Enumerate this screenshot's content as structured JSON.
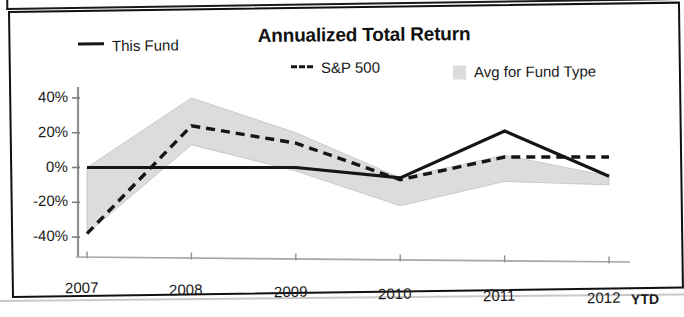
{
  "chart_data": {
    "type": "line",
    "title": "Annualized Total Return",
    "xlabel": "",
    "ylabel": "",
    "categories": [
      "2007",
      "2008",
      "2009",
      "2010",
      "2011",
      "2012"
    ],
    "x_axis_suffix_label": "YTD",
    "ytick_labels": [
      "40%",
      "20%",
      "0%",
      "-20%",
      "-40%"
    ],
    "ytick_values": [
      40,
      20,
      0,
      -20,
      -40
    ],
    "ylim": [
      -48,
      44
    ],
    "grid": false,
    "legend_position": "top",
    "series": [
      {
        "name": "This Fund",
        "style": "solid",
        "color": "#151515",
        "values": [
          0,
          0,
          0,
          -6,
          21,
          -5
        ]
      },
      {
        "name": "S&P 500",
        "style": "dashed",
        "color": "#151515",
        "values": [
          -38,
          24,
          14,
          -7,
          6,
          6
        ]
      },
      {
        "name": "Avg for Fund Type",
        "style": "band",
        "color": "#dcdcdc",
        "band_upper": [
          0,
          40,
          20,
          -6,
          7,
          -5
        ],
        "band_lower": [
          -38,
          13,
          -2,
          -22,
          -8,
          -10
        ]
      }
    ]
  },
  "chart": {
    "title": "Annualized Total Return",
    "legend": [
      {
        "label": "This Fund",
        "marker": "solid-line-swatch"
      },
      {
        "label": "S&P 500",
        "marker": "dashed-line-swatch"
      },
      {
        "label": "Avg for Fund Type",
        "marker": "gray-band-swatch"
      }
    ],
    "y_axis": {
      "ticks": [
        "40%",
        "20%",
        "0%",
        "-20%",
        "-40%"
      ]
    },
    "x_axis": {
      "ticks": [
        "2007",
        "2008",
        "2009",
        "2010",
        "2011",
        "2012"
      ],
      "suffix": "YTD"
    }
  },
  "colors": {
    "line": "#151515",
    "band": "#dcdcdc",
    "axis": "#8a8a8a",
    "frame": "#111111"
  }
}
